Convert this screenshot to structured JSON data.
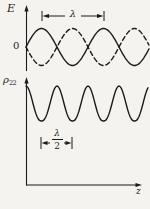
{
  "figure": {
    "top_graph": {
      "y_axis_label": "E",
      "origin_label": "0",
      "dimension_label": "λ"
    },
    "bottom_graph": {
      "y_axis_label": "ρ",
      "y_axis_label_subscript": "22",
      "dimension_numerator": "λ",
      "dimension_denominator": "2",
      "x_axis_label": "z"
    },
    "colors": {
      "ink": "#1b1b1b",
      "paper": "#f4f3ef"
    }
  }
}
